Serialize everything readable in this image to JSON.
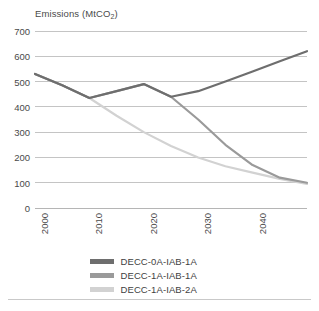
{
  "chart": {
    "axis_title": "Emissions (MtCO",
    "axis_title_sub": "2",
    "axis_title_tail": ")"
  },
  "chart_data": {
    "type": "line",
    "title": "",
    "ylabel": "Emissions (MtCO2)",
    "xlabel": "",
    "ylim": [
      0,
      700
    ],
    "xlim": [
      2000,
      2050
    ],
    "yticks": [
      0,
      100,
      200,
      300,
      400,
      500,
      600,
      700
    ],
    "ytick_labels": [
      "0",
      "100",
      "200",
      "300",
      "400",
      "500",
      "600",
      "700"
    ],
    "xticks": [
      2000,
      2010,
      2020,
      2030,
      2040
    ],
    "xtick_labels": [
      "2000",
      "2010",
      "2020",
      "2030",
      "2040"
    ],
    "grid": "horizontal",
    "legend_position": "bottom",
    "x": [
      2000,
      2005,
      2010,
      2015,
      2020,
      2025,
      2030,
      2035,
      2040,
      2045,
      2050
    ],
    "series": [
      {
        "name": "DECC-0A-IAB-1A",
        "color": "#6e6e6e",
        "values": [
          530,
          485,
          435,
          462,
          490,
          440,
          462,
          500,
          540,
          580,
          620
        ]
      },
      {
        "name": "DECC-1A-IAB-1A",
        "color": "#9a9a9a",
        "values": [
          530,
          485,
          435,
          462,
          490,
          440,
          350,
          250,
          170,
          120,
          100
        ]
      },
      {
        "name": "DECC-1A-IAB-2A",
        "color": "#d2d2d2",
        "values": [
          530,
          485,
          435,
          365,
          300,
          245,
          200,
          165,
          140,
          115,
          95
        ]
      }
    ]
  },
  "legend": {
    "items": [
      {
        "label": "DECC-0A-IAB-1A",
        "color": "#6e6e6e"
      },
      {
        "label": "DECC-1A-IAB-1A",
        "color": "#9a9a9a"
      },
      {
        "label": "DECC-1A-IAB-2A",
        "color": "#d2d2d2"
      }
    ]
  },
  "style": {
    "gridline_color": "#c4c4c4",
    "axis_color": "#b5b5b5",
    "text_color": "#4a4a4a",
    "background": "#ffffff"
  }
}
